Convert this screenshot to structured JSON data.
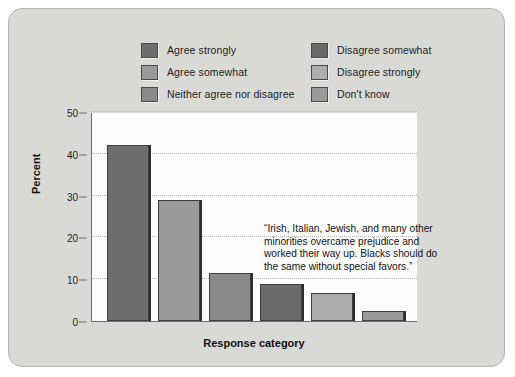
{
  "figure": {
    "background_color": "#d9d9d6",
    "plot_background_color": "#fdfdfd"
  },
  "legend": {
    "position": "top-center",
    "columns": [
      {
        "items": [
          {
            "label": "Agree strongly",
            "color": "#6e6e6e",
            "icon": "legend-swatch"
          },
          {
            "label": "Agree somewhat",
            "color": "#9a9a9a",
            "icon": "legend-swatch"
          },
          {
            "label": "Neither agree nor disagree",
            "color": "#8a8a8a",
            "icon": "legend-swatch"
          }
        ]
      },
      {
        "items": [
          {
            "label": "Disagree somewhat",
            "color": "#6a6a6a",
            "icon": "legend-swatch"
          },
          {
            "label": "Disagree strongly",
            "color": "#adadad",
            "icon": "legend-swatch"
          },
          {
            "label": "Don't know",
            "color": "#9b9b9b",
            "icon": "legend-swatch"
          }
        ]
      }
    ]
  },
  "annotation": {
    "text": "“Irish, Italian, Jewish, and many other minorities overcame prejudice and worked their way up. Blacks should do the same without special favors.”"
  },
  "chart_data": {
    "type": "bar",
    "title": "",
    "xlabel": "Response category",
    "ylabel": "Percent",
    "ylim": [
      0,
      50
    ],
    "yticks": [
      0,
      10,
      20,
      30,
      40,
      50
    ],
    "grid": true,
    "grid_style": "dotted horizontal",
    "categories": [
      "Agree strongly",
      "Agree somewhat",
      "Neither agree nor disagree",
      "Disagree somewhat",
      "Disagree strongly",
      "Don't know"
    ],
    "values": [
      42.0,
      29.0,
      11.5,
      8.8,
      6.7,
      2.5
    ],
    "colors": [
      "#6e6e6e",
      "#9a9a9a",
      "#8a8a8a",
      "#6a6a6a",
      "#adadad",
      "#9b9b9b"
    ],
    "units": "percent"
  }
}
